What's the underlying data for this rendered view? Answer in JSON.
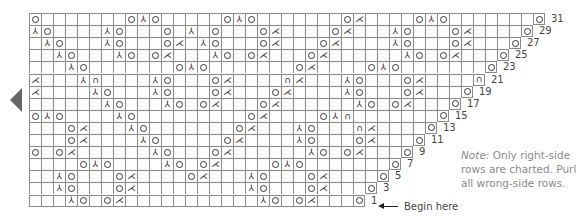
{
  "chart_title": "",
  "symbols": {
    "O": "yarn over",
    "L": "k2tog",
    "R": "ssk",
    "S": "sk2p",
    "U": "bobble/cluster"
  },
  "glyphs": {
    "O": "",
    "L": "⋌",
    "R": "⅄",
    "S": "⅄",
    "U": "∩"
  },
  "rows": [
    {
      "num": "31",
      "width": 43,
      "stitches": {
        "0": "O",
        "8": "O",
        "9": "S",
        "10": "O",
        "16": "O",
        "17": "S",
        "18": "O",
        "26": "O",
        "27": "L",
        "32": "O",
        "33": "S",
        "34": "O",
        "42": "O"
      }
    },
    {
      "num": "29",
      "width": 42,
      "stitches": {
        "0": "R",
        "1": "O",
        "6": "R",
        "7": "O",
        "11": "O",
        "13": "S",
        "15": "O",
        "19": "O",
        "20": "L",
        "25": "O",
        "26": "L",
        "30": "R",
        "31": "O",
        "35": "O",
        "36": "L",
        "41": "O"
      }
    },
    {
      "num": "27",
      "width": 41,
      "stitches": {
        "1": "R",
        "2": "O",
        "6": "R",
        "7": "O",
        "11": "O",
        "12": "L",
        "14": "R",
        "15": "O",
        "19": "O",
        "20": "L",
        "24": "O",
        "25": "L",
        "30": "R",
        "31": "O",
        "35": "O",
        "36": "L",
        "40": "O"
      }
    },
    {
      "num": "25",
      "width": 40,
      "stitches": {
        "2": "R",
        "3": "O",
        "7": "R",
        "8": "O",
        "10": "O",
        "11": "L",
        "15": "R",
        "16": "O",
        "18": "O",
        "19": "L",
        "23": "O",
        "24": "L",
        "31": "R",
        "32": "O",
        "34": "O",
        "35": "L",
        "39": "O"
      }
    },
    {
      "num": "23",
      "width": 39,
      "stitches": {
        "3": "R",
        "4": "O",
        "12": "O",
        "13": "S",
        "14": "O",
        "22": "O",
        "23": "L",
        "28": "O",
        "29": "S",
        "30": "O",
        "38": "O"
      }
    },
    {
      "num": "21",
      "width": 38,
      "stitches": {
        "0": "L",
        "4": "R",
        "5": "U",
        "10": "R",
        "11": "O",
        "15": "O",
        "16": "L",
        "21": "U",
        "22": "L",
        "26": "R",
        "27": "O",
        "31": "O",
        "32": "L",
        "37": "U"
      }
    },
    {
      "num": "19",
      "width": 37,
      "stitches": {
        "0": "L",
        "5": "R",
        "6": "O",
        "10": "R",
        "11": "O",
        "15": "O",
        "16": "L",
        "20": "O",
        "21": "L",
        "26": "R",
        "27": "O",
        "31": "O",
        "32": "L",
        "36": "O"
      }
    },
    {
      "num": "17",
      "width": 36,
      "stitches": {
        "6": "R",
        "7": "O",
        "11": "R",
        "12": "O",
        "14": "O",
        "15": "L",
        "19": "O",
        "20": "L",
        "27": "R",
        "28": "O",
        "30": "O",
        "31": "L",
        "35": "O"
      }
    },
    {
      "num": "15",
      "width": 35,
      "stitches": {
        "0": "O",
        "1": "S",
        "2": "O",
        "7": "R",
        "8": "O",
        "18": "O",
        "19": "L",
        "24": "O",
        "25": "S",
        "26": "U",
        "34": "O"
      }
    },
    {
      "num": "13",
      "width": 34,
      "stitches": {
        "3": "O",
        "4": "L",
        "8": "R",
        "9": "O",
        "17": "O",
        "18": "L",
        "22": "R",
        "23": "O",
        "27": "U",
        "28": "L",
        "33": "O"
      }
    },
    {
      "num": "11",
      "width": 33,
      "stitches": {
        "3": "O",
        "4": "L",
        "9": "R",
        "10": "O",
        "16": "O",
        "17": "L",
        "22": "R",
        "23": "O",
        "27": "O",
        "28": "L",
        "32": "O"
      }
    },
    {
      "num": "9",
      "width": 32,
      "stitches": {
        "0": "O",
        "2": "O",
        "3": "L",
        "10": "R",
        "11": "O",
        "15": "O",
        "16": "L",
        "23": "R",
        "24": "O",
        "26": "O",
        "27": "L",
        "31": "O"
      }
    },
    {
      "num": "7",
      "width": 31,
      "stitches": {
        "4": "O",
        "5": "S",
        "6": "O",
        "11": "R",
        "12": "O",
        "14": "O",
        "15": "L",
        "20": "O",
        "21": "S",
        "22": "O",
        "30": "O"
      }
    },
    {
      "num": "5",
      "width": 30,
      "stitches": {
        "2": "R",
        "3": "O",
        "7": "O",
        "8": "L",
        "13": "O",
        "14": "L",
        "18": "R",
        "19": "O",
        "23": "O",
        "24": "L",
        "29": "O"
      }
    },
    {
      "num": "3",
      "width": 29,
      "stitches": {
        "2": "R",
        "3": "O",
        "7": "O",
        "8": "L",
        "18": "R",
        "19": "O",
        "23": "O",
        "24": "L",
        "28": "O"
      }
    },
    {
      "num": "1",
      "width": 28,
      "stitches": {
        "3": "R",
        "4": "O",
        "6": "O",
        "7": "L",
        "19": "R",
        "20": "O",
        "22": "O",
        "23": "L",
        "27": "O"
      }
    }
  ],
  "begin_label": "Begin here",
  "note": {
    "prefix": "Note:",
    "text": " Only right-side rows are charted. Purl all wrong-side rows."
  },
  "colors": {
    "grid": "#8a8a8a",
    "arrow": "#666666",
    "note": "#8a8a8a"
  }
}
